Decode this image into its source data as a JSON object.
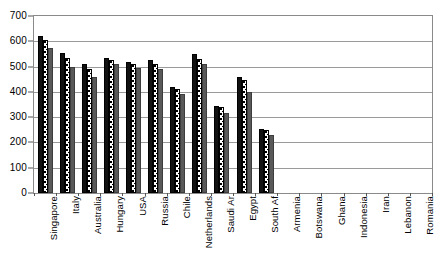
{
  "chart_data": {
    "type": "bar",
    "title": "",
    "subtitle": "",
    "xlabel": "",
    "ylabel": "",
    "ylim": [
      0,
      700
    ],
    "ytick_step": 100,
    "yticks": [
      "0",
      "100",
      "200",
      "300",
      "400",
      "500",
      "600",
      "700"
    ],
    "grid": true,
    "grid_axis": "y",
    "legend": false,
    "legend_position": "none",
    "annotations": [],
    "bar_group_count": 3,
    "categories": [
      "Singapore",
      "Italy",
      "Australia",
      "Hungary",
      "USA",
      "Russia",
      "Chile",
      "Netherlands",
      "Saudi Ar",
      "Egypt",
      "South Af",
      "Armenia",
      "Botswana",
      "Ghana",
      "Indonesia",
      "Iran",
      "Lebanon",
      "Romania"
    ],
    "series": [
      {
        "name": "series-1",
        "fill": "solid-black",
        "color": "#111111",
        "values": [
          622,
          555,
          510,
          535,
          520,
          525,
          420,
          550,
          345,
          460,
          255,
          null,
          null,
          null,
          null,
          null,
          null,
          null
        ]
      },
      {
        "name": "series-2",
        "fill": "dotted-white",
        "color": "#ffffff",
        "values": [
          605,
          535,
          490,
          525,
          512,
          512,
          410,
          530,
          340,
          445,
          250,
          null,
          null,
          null,
          null,
          null,
          null,
          null
        ]
      },
      {
        "name": "series-3",
        "fill": "solid-gray",
        "color": "#595959",
        "values": [
          572,
          500,
          460,
          512,
          495,
          492,
          390,
          510,
          315,
          400,
          230,
          null,
          null,
          null,
          null,
          null,
          null,
          null
        ]
      }
    ]
  },
  "colors": {
    "series_1": "#111111",
    "series_2": "#ffffff",
    "series_3": "#595959",
    "gridline": "#9a9a9a",
    "frame": "#8a8a8a",
    "background": "#ffffff",
    "text": "#000000"
  }
}
